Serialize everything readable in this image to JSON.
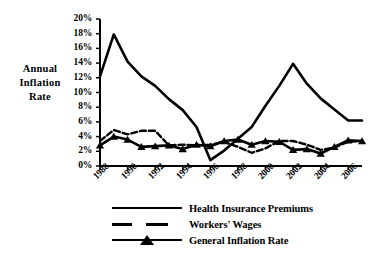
{
  "chart_data": {
    "type": "line",
    "title": "",
    "xlabel": "",
    "ylabel": "Annual Inflation Rate",
    "ylabel_lines": [
      "Annual",
      "Inflation",
      "Rate"
    ],
    "x": [
      1988,
      1989,
      1990,
      1991,
      1992,
      1993,
      1994,
      1995,
      1996,
      1997,
      1998,
      1999,
      2000,
      2001,
      2002,
      2003,
      2004,
      2005,
      2006,
      2007
    ],
    "xlim": [
      1988,
      2007
    ],
    "ylim": [
      0,
      20
    ],
    "ytick_values": [
      0,
      2,
      4,
      6,
      8,
      10,
      12,
      14,
      16,
      18,
      20
    ],
    "ytick_labels": [
      "0%",
      "2%",
      "4%",
      "6%",
      "8%",
      "10%",
      "12%",
      "14%",
      "16%",
      "18%",
      "20%"
    ],
    "xtick_values": [
      1988,
      1990,
      1992,
      1994,
      1996,
      1998,
      2000,
      2002,
      2004,
      2006
    ],
    "xtick_labels": [
      "1988",
      "1990",
      "1992",
      "1994",
      "1996",
      "1998",
      "2000",
      "2002",
      "2004",
      "2006"
    ],
    "grid": false,
    "legend_position": "below",
    "series": [
      {
        "name": "Health Insurance Premiums",
        "style": "solid",
        "marker": "none",
        "color": "#000000",
        "values": [
          12.2,
          17.9,
          14.2,
          12.2,
          10.9,
          9.1,
          7.6,
          5.3,
          0.8,
          2.1,
          3.7,
          5.3,
          8.2,
          10.9,
          13.9,
          11.2,
          9.2,
          7.7,
          6.2,
          6.2
        ]
      },
      {
        "name": "Workers' Wages",
        "style": "dashed",
        "marker": "none",
        "color": "#000000",
        "values": [
          3.4,
          4.9,
          4.3,
          4.8,
          4.8,
          2.8,
          2.9,
          2.8,
          2.9,
          3.3,
          2.6,
          1.8,
          2.4,
          3.4,
          3.4,
          2.9,
          2.2,
          2.5,
          3.3,
          3.4
        ]
      },
      {
        "name": "General Inflation Rate",
        "style": "solid",
        "marker": "triangle",
        "color": "#000000",
        "values": [
          2.8,
          4.0,
          3.6,
          2.6,
          2.7,
          2.8,
          2.3,
          2.9,
          2.7,
          3.4,
          3.6,
          2.9,
          3.4,
          3.3,
          2.2,
          2.3,
          1.7,
          2.6,
          3.5,
          3.4
        ]
      }
    ]
  },
  "legend": {
    "items": [
      {
        "label": "Health Insurance Premiums",
        "key": "solid-line-key"
      },
      {
        "label": "Workers' Wages",
        "key": "dashed-line-key"
      },
      {
        "label": "General Inflation Rate",
        "key": "triangle-marker-line-key"
      }
    ]
  },
  "colors": {
    "ink": "#000000",
    "background": "#ffffff"
  }
}
